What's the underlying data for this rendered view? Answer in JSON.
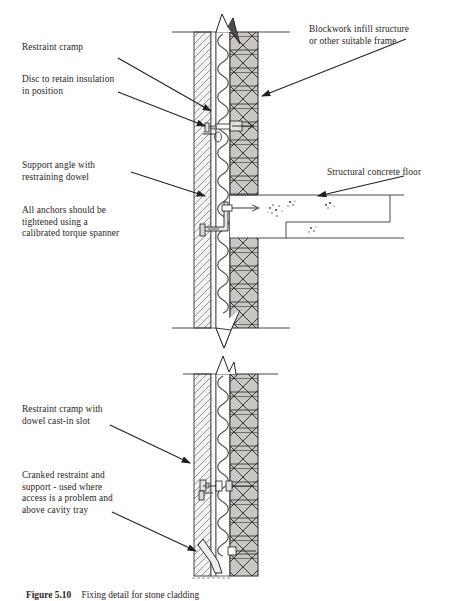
{
  "figure": {
    "caption_label": "Figure 5.10",
    "caption_text": "Fixing detail for stone cladding",
    "caption_full": "Figure 5.10   Fixing detail for stone cladding"
  },
  "diagram_top": {
    "labels": [
      {
        "id": "restraint-cramp",
        "text": "Restraint cramp",
        "x": 22,
        "y": 42
      },
      {
        "id": "disc-retain-insulation",
        "text": "Disc to retain insulation\nin position",
        "x": 22,
        "y": 74
      },
      {
        "id": "support-angle",
        "text": "Support angle with\nrestraining dowel",
        "x": 22,
        "y": 160
      },
      {
        "id": "all-anchors-torque",
        "text": "All anchors should be\ntightened using a\ncalibrated torque spanner",
        "x": 22,
        "y": 205
      },
      {
        "id": "blockwork-infill",
        "text": "Blockwork infill structure\nor other suitable frame",
        "x": 309,
        "y": 24
      },
      {
        "id": "structural-concrete-floor",
        "text": "Structural concrete floor",
        "x": 327,
        "y": 167
      }
    ]
  },
  "diagram_bottom": {
    "labels": [
      {
        "id": "restraint-cramp-dowel-slot",
        "text": "Restraint cramp with\ndowel cast-in slot",
        "x": 22,
        "y": 404
      },
      {
        "id": "cranked-restraint-support",
        "text": "Cranked restraint and\nsupport  - used where\naccess is a problem and\nabove cavity tray",
        "x": 22,
        "y": 470
      }
    ]
  },
  "colors": {
    "ink": "#231f20",
    "stone_hatch": "#8c8a88",
    "stone_fill": "#f2f1ef",
    "insulation_line": "#4d4a47",
    "blockwork_fill": "#c9c7c4",
    "blockwork_line": "#2b2826",
    "cavity_fill": "#ffffff",
    "metal_fill": "#e3e1de",
    "concrete_fill": "#ffffff",
    "aggregate": "#3a3734"
  },
  "components": {
    "stone_cladding": "stone-cladding-layer",
    "cavity": "cavity-layer",
    "insulation": "insulation-layer",
    "blockwork": "blockwork-layer",
    "concrete_floor": "structural-concrete-floor-slab",
    "support_angle": "support-angle-bracket",
    "restraint_cramp": "restraint-cramp-fixing",
    "cranked_restraint": "cranked-restraint-bracket",
    "insulation_disc": "insulation-retaining-disc",
    "break_line": "section-break-line"
  }
}
